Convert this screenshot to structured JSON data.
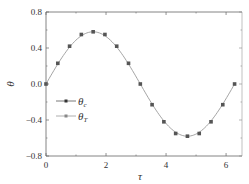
{
  "chart_data": {
    "type": "line",
    "title": "",
    "xlabel": "τ",
    "ylabel": "θ",
    "xlim": [
      0,
      6.53
    ],
    "ylim": [
      -0.8,
      0.8
    ],
    "xticks": [
      0,
      2,
      4,
      6
    ],
    "xtick_labels": [
      "0",
      "2",
      "4",
      "6"
    ],
    "yticks": [
      0.8,
      0.4,
      0.0,
      -0.4,
      -0.8
    ],
    "ytick_labels": [
      "0.8",
      "0.4",
      "0.0",
      "−0.4",
      "−0.8"
    ],
    "grid": false,
    "legend_position": "lower-left inside",
    "series": [
      {
        "name": "θc",
        "name_main": "θ",
        "name_sub": "c",
        "style": "markers",
        "color": "#555555",
        "x": [
          0,
          0.393,
          0.785,
          1.178,
          1.571,
          1.963,
          2.356,
          2.749,
          3.142,
          3.534,
          3.927,
          4.32,
          4.712,
          5.105,
          5.498,
          5.89,
          6.283
        ],
        "values": [
          0.0,
          0.23,
          0.42,
          0.55,
          0.58,
          0.55,
          0.42,
          0.23,
          0.0,
          -0.23,
          -0.42,
          -0.55,
          -0.58,
          -0.55,
          -0.42,
          -0.23,
          0.0
        ]
      },
      {
        "name": "θT",
        "name_main": "θ",
        "name_sub": "T",
        "style": "line",
        "color": "#9a9a9a",
        "function": "0.58*sin(τ)",
        "x_range": [
          0,
          6.283
        ]
      }
    ]
  }
}
